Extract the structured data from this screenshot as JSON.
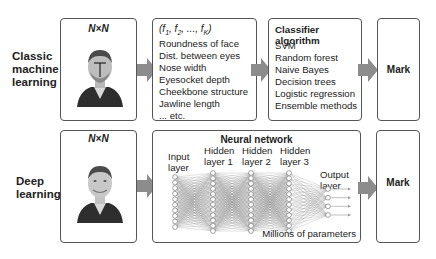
{
  "rows": [
    {
      "label": "Classic machine learning",
      "label_lines": [
        "Classic",
        "machine",
        "learning"
      ],
      "input_box": {
        "title": "N×N",
        "image": "face-photo-with-feature-marks"
      },
      "features_box": {
        "header": "(f1, f2, ..., fK)",
        "header_parts": [
          "(f",
          "1",
          ", f",
          "2",
          ", ..., f",
          "K",
          ")"
        ],
        "items": [
          "Roundness of face",
          "Dist. between eyes",
          "Nose width",
          "Eyesocket depth",
          "Cheekbone structure",
          "Jawline length",
          "... etc."
        ]
      },
      "classifier_box": {
        "header": "Classifier algorithm",
        "items": [
          "SVM",
          "Random forest",
          "Naive Bayes",
          "Decision trees",
          "Logistic regression",
          "Ensemble methods"
        ]
      },
      "output_box": {
        "label": "Mark"
      }
    },
    {
      "label": "Deep learning",
      "label_lines": [
        "Deep",
        "learning"
      ],
      "input_box": {
        "title": "N×N",
        "image": "face-photo"
      },
      "network_box": {
        "title": "Neural network",
        "layers": [
          {
            "label_lines": [
              "Input",
              "layer"
            ],
            "nodes": 10
          },
          {
            "label_lines": [
              "Hidden",
              "layer 1"
            ],
            "nodes": 12
          },
          {
            "label_lines": [
              "Hidden",
              "layer 2"
            ],
            "nodes": 12
          },
          {
            "label_lines": [
              "Hidden",
              "layer 3"
            ],
            "nodes": 12
          },
          {
            "label_lines": [
              "Output",
              "layer"
            ],
            "nodes": 4
          }
        ],
        "footer": "Millions of parameters"
      },
      "output_box": {
        "label": "Mark"
      }
    }
  ],
  "colors": {
    "arrow": "#8c8c8c",
    "border": "#555555",
    "text": "#222222",
    "network_lines": "#9a9a9a"
  }
}
